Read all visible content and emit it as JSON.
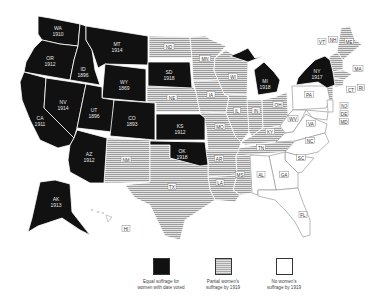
{
  "map": {
    "title": "",
    "colors": {
      "full_suffrage": "#111111",
      "partial_suffrage": "#bdbdbd",
      "no_suffrage": "#ffffff"
    },
    "states_full_suffrage": [
      {
        "abbr": "WA",
        "year": "1910"
      },
      {
        "abbr": "OR",
        "year": "1912"
      },
      {
        "abbr": "CA",
        "year": "1911"
      },
      {
        "abbr": "ID",
        "year": "1896"
      },
      {
        "abbr": "NV",
        "year": "1914"
      },
      {
        "abbr": "MT",
        "year": "1914"
      },
      {
        "abbr": "WY",
        "year": "1869"
      },
      {
        "abbr": "UT",
        "year": "1896"
      },
      {
        "abbr": "AZ",
        "year": "1912"
      },
      {
        "abbr": "CO",
        "year": "1893"
      },
      {
        "abbr": "SD",
        "year": "1918"
      },
      {
        "abbr": "KS",
        "year": "1912"
      },
      {
        "abbr": "OK",
        "year": "1918"
      },
      {
        "abbr": "MI",
        "year": "1918"
      },
      {
        "abbr": "NY",
        "year": "1917"
      },
      {
        "abbr": "AK",
        "year": "1913"
      }
    ],
    "states_partial_suffrage": [
      "ND",
      "MN",
      "NE",
      "IA",
      "WI",
      "IL",
      "IN",
      "OH",
      "MO",
      "KY",
      "TN",
      "AR",
      "MS",
      "LA",
      "NM",
      "TX",
      "ME",
      "VT",
      "NH",
      "MA",
      "CT",
      "RI",
      "HI"
    ],
    "states_no_suffrage": [
      "PA",
      "WV",
      "VA",
      "NC",
      "SC",
      "GA",
      "AL",
      "FL",
      "NJ",
      "DE",
      "MD"
    ]
  },
  "labels": {
    "WA": "WA",
    "WA_y": "1910",
    "OR": "OR",
    "OR_y": "1912",
    "CA": "CA",
    "CA_y": "1911",
    "ID": "ID",
    "ID_y": "1896",
    "NV": "NV",
    "NV_y": "1914",
    "MT": "MT",
    "MT_y": "1914",
    "WY": "WY",
    "WY_y": "1869",
    "UT": "UT",
    "UT_y": "1896",
    "AZ": "AZ",
    "AZ_y": "1912",
    "CO": "CO",
    "CO_y": "1893",
    "SD": "SD",
    "SD_y": "1918",
    "KS": "KS",
    "KS_y": "1912",
    "OK": "OK",
    "OK_y": "1918",
    "MI": "MI",
    "MI_y": "1918",
    "NY": "NY",
    "NY_y": "1917",
    "AK": "AK",
    "AK_y": "1913",
    "ND": "ND",
    "MN": "MN",
    "NE": "NE",
    "IA": "IA",
    "WI": "WI",
    "IL": "IL",
    "IN": "IN",
    "OH": "OH",
    "MO": "MO",
    "KY": "KY",
    "TN": "TN",
    "AR": "AR",
    "MS": "MS",
    "LA": "LA",
    "NM": "NM",
    "TX": "TX",
    "ME": "ME",
    "VT": "VT",
    "NH": "NH",
    "MA": "MA",
    "CT": "CT",
    "RI": "RI",
    "HI": "HI",
    "PA": "PA",
    "WV": "WV",
    "VA": "VA",
    "NC": "NC",
    "SC": "SC",
    "GA": "GA",
    "AL": "AL",
    "FL": "FL",
    "NJ": "NJ",
    "DE": "DE",
    "MD": "MD"
  },
  "legend": {
    "items": [
      {
        "label_line1": "Equal suffrage for",
        "label_line2": "women with date voted"
      },
      {
        "label_line1": "Partial women's",
        "label_line2": "suffrage by 1919"
      },
      {
        "label_line1": "No women's",
        "label_line2": "suffrage by 1919"
      }
    ]
  }
}
